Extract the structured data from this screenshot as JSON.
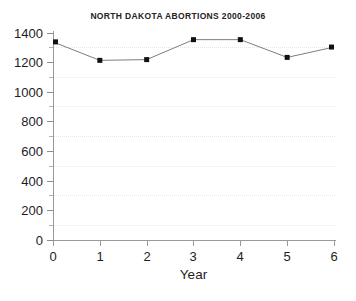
{
  "chart_data": {
    "type": "line",
    "title": "NORTH DAKOTA ABORTIONS 2000-2006",
    "xlabel": "Year",
    "ylabel": "",
    "x": [
      0,
      1,
      2,
      3,
      4,
      5,
      6
    ],
    "values": [
      1340,
      1215,
      1220,
      1355,
      1355,
      1235,
      1305
    ],
    "series": [
      {
        "name": "North Dakota abortions",
        "values": [
          1340,
          1215,
          1220,
          1355,
          1355,
          1235,
          1305
        ]
      }
    ],
    "xlim": [
      0,
      6
    ],
    "ylim": [
      0,
      1400
    ],
    "xticks": [
      0,
      1,
      2,
      3,
      4,
      5,
      6
    ],
    "yticks": [
      0,
      200,
      400,
      600,
      800,
      1000,
      1200,
      1400
    ],
    "y_minor_gridlines": [
      100,
      300,
      500,
      700,
      900,
      1100,
      1300
    ],
    "grid": true,
    "grid_style": "dotted",
    "legend": null,
    "marker": "square",
    "line_color": "#7d7d7d",
    "marker_color": "#111111",
    "grid_color": "#e9e6e4",
    "axis_color": "#9a9a9a",
    "background_color": "#ffffff"
  },
  "axes": {
    "y_tick_labels": [
      "1400",
      "1200",
      "1000",
      "800",
      "600",
      "400",
      "200",
      "0"
    ],
    "x_tick_labels": [
      "0",
      "1",
      "2",
      "3",
      "4",
      "5",
      "6"
    ],
    "x_axis_title": "Year"
  },
  "header": {
    "title": "NORTH DAKOTA ABORTIONS 2000-2006"
  }
}
